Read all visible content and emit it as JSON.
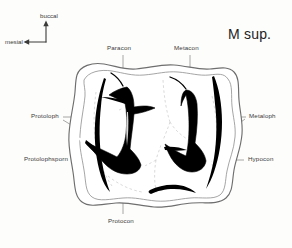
{
  "figure": {
    "title": "M sup.",
    "orientation": {
      "up_label": "buccal",
      "left_label": "mesial"
    },
    "labels": {
      "paracon": "Paracon",
      "metacon": "Metacon",
      "protoloph": "Protoloph",
      "metaloph": "Metaloph",
      "protolophsporn": "Protolophsporn",
      "hypocon": "Hypocon",
      "protocon": "Protocon"
    },
    "colors": {
      "background": "#fdfdfc",
      "outline": "#6e6e6e",
      "enamel_fill": "#000000",
      "leader_line": "#8a8a8a",
      "dashed_guide": "#c9c9c9",
      "text": "#3a3a38",
      "title_text": "#232323"
    }
  }
}
